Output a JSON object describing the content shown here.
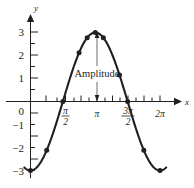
{
  "figure": {
    "background_color": "#ffffff",
    "ink_color": "#231f20",
    "annotation_color": "#5b5b5b"
  },
  "axes": {
    "x_axis_label": "x",
    "y_axis_label": "y",
    "y_tick_labels": [
      "3",
      "2",
      "1",
      "0",
      "−1",
      "−2",
      "−3"
    ],
    "y_tick_values": [
      3,
      2,
      1,
      0,
      -1,
      -2,
      -3
    ],
    "x_tick_labels": [
      {
        "numerator": "π",
        "denominator": "2",
        "display": "π/2",
        "value": 1.5708
      },
      {
        "numerator": "π",
        "denominator": "",
        "display": "π",
        "value": 3.1416
      },
      {
        "numerator": "3π",
        "denominator": "2",
        "display": "3π/2",
        "value": 4.7124
      },
      {
        "numerator": "2π",
        "denominator": "",
        "display": "2π",
        "value": 6.2832
      }
    ]
  },
  "annotation": {
    "label": "Amplitude",
    "arrow": "double-headed-vertical",
    "from_y": 3,
    "to_y": 0,
    "at_x": "π"
  },
  "chart_data": {
    "type": "line",
    "title": "",
    "xlabel": "x",
    "ylabel": "y",
    "xlim": [
      -0.35,
      7.0
    ],
    "ylim": [
      -3.3,
      3.4
    ],
    "grid": false,
    "legend": null,
    "function": "y = -3 cos(x)",
    "amplitude": 3,
    "period": 6.2832,
    "series": [
      {
        "name": "y = -3 cos(x)",
        "marker": "filled-circle",
        "x": [
          0,
          0.3927,
          0.7854,
          1.1781,
          1.5708,
          1.9635,
          2.3562,
          2.7489,
          3.1416,
          3.5343,
          3.927,
          4.3197,
          4.7124,
          5.1051,
          5.4978,
          5.8905,
          6.2832
        ],
        "y": [
          -3,
          -2.772,
          -2.121,
          -1.148,
          0,
          1.148,
          2.121,
          2.772,
          3,
          2.772,
          2.121,
          1.148,
          0,
          -1.148,
          -2.121,
          -2.772,
          -3
        ]
      }
    ],
    "marked_points_x": [
      0,
      0.7854,
      1.5708,
      2.3562,
      2.7489,
      3.1416,
      3.5343,
      4.3197,
      4.7124,
      5.4978,
      6.2832
    ],
    "marked_points_y": [
      -3,
      -2.121,
      0,
      2.121,
      2.772,
      3,
      2.772,
      1.148,
      0,
      -2.121,
      -3
    ],
    "annotations": [
      {
        "text": "Amplitude",
        "x": 3.1416,
        "y": 1.3,
        "arrow_top_y": 3,
        "arrow_bottom_y": 0
      }
    ]
  }
}
